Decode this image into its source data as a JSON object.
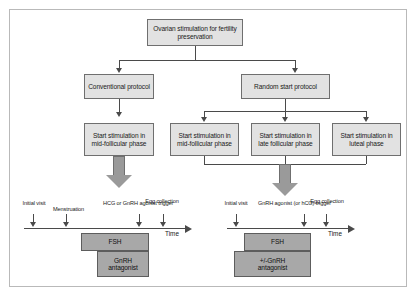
{
  "diagram": {
    "title_node": "Ovarian stimulation for fertility preservation",
    "nodes": {
      "root": "Ovarian stimulation for fertility preservation",
      "conventional": "Conventional protocol",
      "random": "Random start protocol",
      "conv_mid": "Start stimulation in mid-follicular phase",
      "rand_mid": "Start stimulation in mid-follicular phase",
      "rand_late": "Start stimulation in late follicular phase",
      "rand_luteal": "Start stimulation in luteal phase"
    }
  },
  "timeline_left": {
    "events": [
      {
        "label_line1": "Initial",
        "label_line2": "visit"
      },
      {
        "label_line1": "Menstruation",
        "label_line2": ""
      },
      {
        "label_line1": "HCG or GnRH",
        "label_line2": "agonist trigger"
      },
      {
        "label_line1": "Egg",
        "label_line2": "collection"
      }
    ],
    "axis_label": "Time",
    "bars": [
      {
        "label": "FSH"
      },
      {
        "label_line1": "GnRH",
        "label_line2": "antagonist"
      }
    ]
  },
  "timeline_right": {
    "events": [
      {
        "label_line1": "Initial",
        "label_line2": "visit"
      },
      {
        "label_line1": "GnRH agonist",
        "label_line2": "(or hCG) trigger"
      },
      {
        "label_line1": "Egg",
        "label_line2": "collection"
      }
    ],
    "axis_label": "Time",
    "bars": [
      {
        "label": "FSH"
      },
      {
        "label_line1": "+/-GnRH",
        "label_line2": "antagonist"
      }
    ]
  },
  "colors": {
    "node_fill": "#e2e2e2",
    "node_stroke": "#6f6f6f",
    "bar_fill": "#a8a8a8",
    "bar_stroke": "#5d5d5d",
    "arrow_fill": "#9a9a9a",
    "line": "#4a4a4a",
    "frame": "#b9b9b9"
  }
}
